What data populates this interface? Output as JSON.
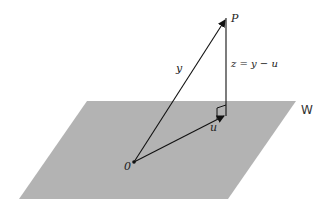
{
  "diagram": {
    "plane": {
      "label": "W",
      "fill": "#b3b3b3",
      "corners": [
        [
          87,
          101
        ],
        [
          296,
          101
        ],
        [
          228,
          199
        ],
        [
          19,
          199
        ]
      ]
    },
    "points": {
      "origin": {
        "label": "0",
        "x": 134,
        "y": 162
      },
      "P": {
        "label": "P",
        "x": 226,
        "y": 18
      },
      "u_tip": {
        "x": 225,
        "y": 115
      }
    },
    "vectors": [
      {
        "name": "y",
        "label": "y",
        "from": "origin",
        "to": "P"
      },
      {
        "name": "u",
        "label": "u",
        "from": "origin",
        "to": "u_tip"
      },
      {
        "name": "z",
        "label": "z = y − u",
        "from": "u_tip",
        "to": "P"
      }
    ],
    "right_angle_marker": true,
    "line_color": "#111111"
  },
  "labels": {
    "P": "P",
    "y": "y",
    "z": "z = y − u",
    "W": "W",
    "u": "u",
    "origin": "0"
  }
}
